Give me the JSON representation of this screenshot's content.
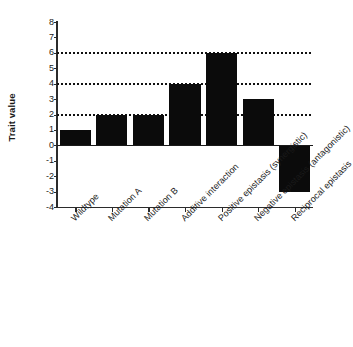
{
  "chart_data": {
    "type": "bar",
    "title": "",
    "subtitle": "",
    "xlabel": "",
    "ylabel": "Trait value",
    "categories": [
      "Wildtype",
      "Mutation A",
      "Mutation B",
      "Additive interaction",
      "Positive epistasis (synergistic)",
      "Negative epistasis (antagonistic)",
      "Reciprocal epistasis"
    ],
    "values": [
      1,
      2,
      2,
      4,
      6,
      3,
      -3
    ],
    "ylim": [
      -4,
      8
    ],
    "ytick_labels": [
      "8",
      "7",
      "6",
      "5",
      "4",
      "3",
      "2",
      "1",
      "0",
      "-1",
      "-2",
      "-3",
      "-4"
    ],
    "ytick_values": [
      8,
      7,
      6,
      5,
      4,
      3,
      2,
      1,
      0,
      -1,
      -2,
      -3,
      -4
    ],
    "gridlines": {
      "enabled": true,
      "style": "dotted",
      "values": [
        6,
        4,
        2
      ],
      "color": "#111111"
    },
    "bar_color": "#0b0b0b",
    "axis_color": "#2b2b2b",
    "background_color": "#ffffff",
    "legend": {
      "visible": false,
      "position": "none"
    },
    "xtick_label_rotation": -45
  }
}
